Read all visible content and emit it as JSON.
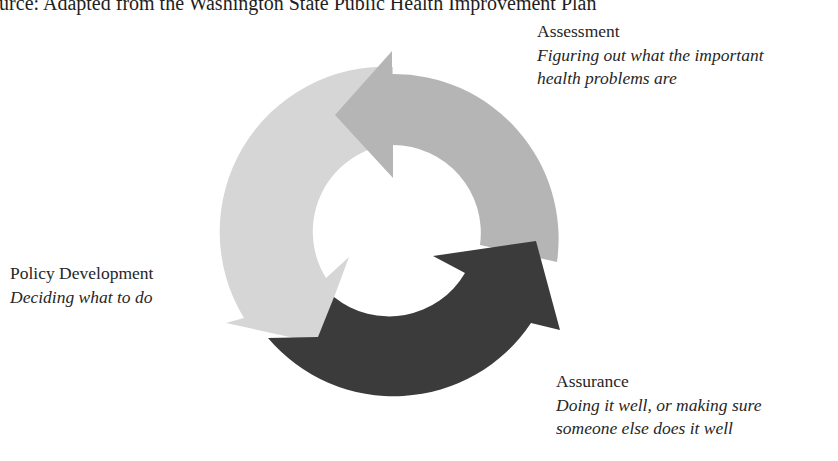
{
  "source": {
    "text": "Source: Adapted from the Washington State Public Health Improvement Plan"
  },
  "diagram": {
    "type": "cycle",
    "colors": {
      "assessment_arrow": "#b5b5b5",
      "policy_arrow": "#d6d6d6",
      "assurance_arrow": "#3b3b3b"
    },
    "stages": [
      {
        "id": "assessment",
        "title": "Assessment",
        "description_lines": [
          "Figuring out what the important",
          "health problems are"
        ]
      },
      {
        "id": "policy",
        "title": "Policy Development",
        "description_lines": [
          "Deciding what to do"
        ]
      },
      {
        "id": "assurance",
        "title": "Assurance",
        "description_lines": [
          "Doing it well, or making sure",
          "someone else does it well"
        ]
      }
    ]
  }
}
